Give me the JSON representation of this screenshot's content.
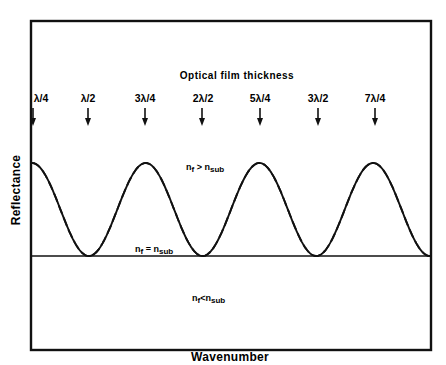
{
  "chart_data": {
    "type": "line",
    "title": "Optical film thickness",
    "xlabel": "Wavenumber",
    "ylabel": "Reflectance",
    "grid": false,
    "legend": "inline curve labels",
    "thickness_markers": [
      "λ/4",
      "λ/2",
      "3λ/4",
      "2λ/2",
      "5λ/4",
      "3λ/2",
      "7λ/4"
    ],
    "series": [
      {
        "name": "n_f > n_sub",
        "style": "solid",
        "description": "oscillates above substrate level; maxima at odd quarter-wave thicknesses, touches baseline at half-wave multiples",
        "x": [
          "λ/4",
          "λ/2",
          "3λ/4",
          "2λ/2",
          "5λ/4",
          "3λ/2",
          "7λ/4",
          "2λ"
        ],
        "values": [
          1,
          0,
          1,
          0,
          1,
          0,
          1,
          0
        ]
      },
      {
        "name": "n_f = n_sub",
        "style": "solid",
        "description": "flat line at substrate reflectance",
        "x": [
          "λ/4",
          "2λ"
        ],
        "values": [
          0,
          0
        ]
      },
      {
        "name": "n_f < n_sub",
        "style": "dashed",
        "description": "oscillates below substrate level; minima at odd quarter-wave thicknesses, touches baseline at half-wave multiples",
        "x": [
          "λ/4",
          "λ/2",
          "3λ/4",
          "2λ/2",
          "5λ/4",
          "3λ/2",
          "7λ/4",
          "2λ"
        ],
        "values": [
          -1,
          0,
          -1,
          0,
          -1,
          0,
          -1,
          0
        ]
      }
    ]
  },
  "figure": {
    "title": "Optical film thickness",
    "x_axis_label": "Wavenumber",
    "y_axis_label": "Reflectance",
    "markers": [
      {
        "label": "λ/4",
        "x": 33
      },
      {
        "label": "λ/2",
        "x": 88
      },
      {
        "label": "3λ/4",
        "x": 145
      },
      {
        "label": "2λ/2",
        "x": 203
      },
      {
        "label": "5λ/4",
        "x": 260
      },
      {
        "label": "3λ/2",
        "x": 318
      },
      {
        "label": "7λ/4",
        "x": 375
      }
    ],
    "curve_labels": {
      "greater": {
        "main": "n",
        "sub1": "f",
        "op": " > ",
        "main2": "n",
        "sub2": "sub"
      },
      "equal": {
        "main": "n",
        "sub1": "f",
        "op": " = ",
        "main2": "n",
        "sub2": "sub"
      },
      "less": {
        "main": "n",
        "sub1": "f",
        "op": "<",
        "main2": "n",
        "sub2": "sub"
      }
    }
  }
}
